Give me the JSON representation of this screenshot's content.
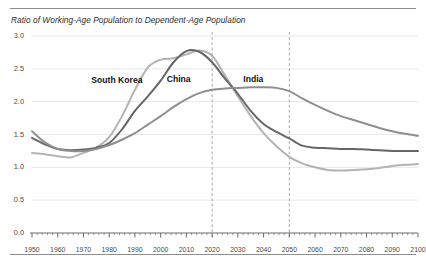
{
  "chart_data": {
    "type": "line",
    "title": "Ratio of Working-Age Population to Dependent-Age Population",
    "xlabel": "",
    "ylabel": "",
    "xlim": [
      1950,
      2100
    ],
    "ylim": [
      0.0,
      3.0
    ],
    "grid": true,
    "legend_position": "inline-annotations",
    "y_ticks": [
      "0.0",
      "0.5",
      "1.0",
      "1.5",
      "2.0",
      "2.5",
      "3.0"
    ],
    "y_tick_values": [
      0.0,
      0.5,
      1.0,
      1.5,
      2.0,
      2.5,
      3.0
    ],
    "x_ticks": [
      "1950",
      "1960",
      "1970",
      "1980",
      "1990",
      "2000",
      "2010",
      "2020",
      "2030",
      "2040",
      "2050",
      "2060",
      "2070",
      "2080",
      "2090",
      "2100"
    ],
    "x_tick_values": [
      1950,
      1960,
      1970,
      1980,
      1990,
      2000,
      2010,
      2020,
      2030,
      2040,
      2050,
      2060,
      2070,
      2080,
      2090,
      2100
    ],
    "x": [
      1950,
      1955,
      1960,
      1965,
      1970,
      1975,
      1980,
      1985,
      1990,
      1995,
      2000,
      2005,
      2010,
      2015,
      2020,
      2025,
      2030,
      2035,
      2040,
      2045,
      2050,
      2055,
      2060,
      2065,
      2070,
      2075,
      2080,
      2085,
      2090,
      2095,
      2100
    ],
    "annotations": [
      {
        "text": "South Korea",
        "x": 1983,
        "y": 2.32
      },
      {
        "text": "China",
        "x": 2007,
        "y": 2.33
      },
      {
        "text": "India",
        "x": 2036,
        "y": 2.33
      }
    ],
    "reference_lines": [
      {
        "x": 2020,
        "style": "dashed"
      },
      {
        "x": 2050,
        "style": "dashed"
      }
    ],
    "series": [
      {
        "name": "South Korea",
        "color": "#b3b3b3",
        "values": [
          1.22,
          1.2,
          1.17,
          1.15,
          1.22,
          1.3,
          1.46,
          1.78,
          2.18,
          2.52,
          2.64,
          2.66,
          2.72,
          2.78,
          2.7,
          2.4,
          2.08,
          1.78,
          1.52,
          1.32,
          1.16,
          1.06,
          1.0,
          0.96,
          0.95,
          0.96,
          0.97,
          0.99,
          1.02,
          1.04,
          1.05
        ]
      },
      {
        "name": "China",
        "color": "#666666",
        "values": [
          1.45,
          1.35,
          1.28,
          1.26,
          1.27,
          1.3,
          1.37,
          1.58,
          1.86,
          2.08,
          2.32,
          2.6,
          2.77,
          2.76,
          2.6,
          2.35,
          2.12,
          1.86,
          1.66,
          1.54,
          1.44,
          1.33,
          1.3,
          1.29,
          1.28,
          1.28,
          1.27,
          1.26,
          1.25,
          1.25,
          1.25
        ]
      },
      {
        "name": "India",
        "color": "#8f8f8f",
        "values": [
          1.55,
          1.38,
          1.28,
          1.25,
          1.25,
          1.28,
          1.34,
          1.42,
          1.52,
          1.65,
          1.78,
          1.92,
          2.04,
          2.13,
          2.18,
          2.2,
          2.21,
          2.22,
          2.22,
          2.21,
          2.16,
          2.05,
          1.95,
          1.86,
          1.78,
          1.72,
          1.66,
          1.6,
          1.55,
          1.51,
          1.48
        ]
      }
    ]
  }
}
